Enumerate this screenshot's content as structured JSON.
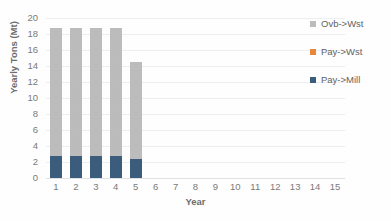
{
  "chart_data": {
    "type": "bar",
    "stacked": true,
    "title": "",
    "xlabel": "Year",
    "ylabel": "Yearly Tons (Mt)",
    "categories": [
      1,
      2,
      3,
      4,
      5,
      6,
      7,
      8,
      9,
      10,
      11,
      12,
      13,
      14,
      15
    ],
    "x_tick_labels": [
      "1",
      "2",
      "3",
      "4",
      "5",
      "6",
      "7",
      "8",
      "9",
      "10",
      "11",
      "12",
      "13",
      "14",
      "15"
    ],
    "xlim": [
      0.5,
      15.5
    ],
    "ylim": [
      0,
      20
    ],
    "y_tick_labels": [
      "0",
      "2",
      "4",
      "6",
      "8",
      "10",
      "12",
      "14",
      "16",
      "18",
      "20"
    ],
    "y_ticks": [
      0,
      2,
      4,
      6,
      8,
      10,
      12,
      14,
      16,
      18,
      20
    ],
    "grid": true,
    "grid_axis": "y",
    "legend_position": "right",
    "series": [
      {
        "name": "Pay->Mill",
        "color": "#3c5c7c",
        "values": [
          2.7,
          2.7,
          2.7,
          2.7,
          2.4,
          0,
          0,
          0,
          0,
          0,
          0,
          0,
          0,
          0,
          0
        ]
      },
      {
        "name": "Pay->Wst",
        "color": "#e8873a",
        "values": [
          0,
          0,
          0,
          0,
          0,
          0,
          0,
          0,
          0,
          0,
          0,
          0,
          0,
          0,
          0
        ]
      },
      {
        "name": "Ovb->Wst",
        "color": "#bcbcbc",
        "values": [
          16.1,
          16.1,
          16.1,
          16.1,
          12.1,
          0,
          0,
          0,
          0,
          0,
          0,
          0,
          0,
          0,
          0
        ]
      }
    ],
    "totals": [
      18.8,
      18.8,
      18.8,
      18.8,
      14.5,
      0,
      0,
      0,
      0,
      0,
      0,
      0,
      0,
      0,
      0
    ],
    "legend_order": [
      "Ovb->Wst",
      "Pay->Wst",
      "Pay->Mill"
    ]
  },
  "legend": {
    "entries": [
      {
        "label": "Ovb->Wst",
        "color": "#bcbcbc"
      },
      {
        "label": "Pay->Wst",
        "color": "#e8873a"
      },
      {
        "label": "Pay->Mill",
        "color": "#3c5c7c"
      }
    ]
  },
  "colors": {
    "background": "#fefefe",
    "gridline": "#eceff1",
    "axis": "#dfe3e6",
    "tick_text": "#7a7a7a",
    "title_text": "#6d6d6d",
    "series_ovb_wst": "#bcbcbc",
    "series_pay_wst": "#e8873a",
    "series_pay_mill": "#3c5c7c"
  }
}
